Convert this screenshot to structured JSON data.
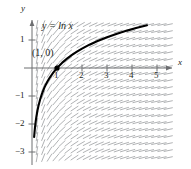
{
  "figure": {
    "background_color": "#ffffff"
  },
  "axes": {
    "x_axis_name": "x",
    "y_axis_name": "y",
    "axis_color": "#6d6e71",
    "origin_px": {
      "x": 32,
      "y": 68
    },
    "unit_px": {
      "x": 25,
      "y": 28
    },
    "x_ticks": [
      {
        "value": 1,
        "label": "1"
      },
      {
        "value": 2,
        "label": "2"
      },
      {
        "value": 3,
        "label": "3"
      },
      {
        "value": 4,
        "label": "4"
      },
      {
        "value": 5,
        "label": "5"
      }
    ],
    "y_ticks": [
      {
        "value": 1,
        "label": "1"
      },
      {
        "value": -1,
        "label": "−1"
      },
      {
        "value": -2,
        "label": "−2"
      },
      {
        "value": -3,
        "label": "−3"
      }
    ]
  },
  "annotations": {
    "equation_label": "y = ln x",
    "point_label": "(1, 0)",
    "point_marker": {
      "x": 1,
      "y": 0,
      "color": "#000000"
    }
  },
  "chart_data": {
    "type": "line",
    "title": "y = ln x",
    "xlabel": "x",
    "ylabel": "y",
    "xlim": [
      -0.2,
      6.2
    ],
    "ylim": [
      -3.5,
      1.7
    ],
    "grid": false,
    "legend": "none",
    "curve_color": "#000000",
    "slope_field": {
      "equation": "dy/dx = 1/x",
      "dash_color": "#a7a9ac",
      "x_samples": [
        0.2,
        0.45,
        0.7,
        0.95,
        1.2,
        1.45,
        1.7,
        1.95,
        2.2,
        2.45,
        2.7,
        2.95,
        3.2,
        3.45,
        3.7,
        3.95,
        4.2,
        4.45,
        4.7,
        4.95,
        5.2,
        5.45,
        5.7,
        5.95
      ],
      "y_samples": [
        1.55,
        1.3,
        1.05,
        0.8,
        0.55,
        0.3,
        0.05,
        -0.2,
        -0.45,
        -0.7,
        -0.95,
        -1.2,
        -1.45,
        -1.7,
        -1.95,
        -2.2,
        -2.45,
        -2.7,
        -2.95,
        -3.2
      ]
    },
    "series": [
      {
        "name": "y = ln x",
        "x": [
          0.085,
          0.1,
          0.12,
          0.15,
          0.18,
          0.22,
          0.27,
          0.33,
          0.4,
          0.5,
          0.6,
          0.7,
          0.85,
          1.0,
          1.2,
          1.4,
          1.6,
          1.8,
          2.0,
          2.3,
          2.6,
          3.0,
          3.4,
          3.8,
          4.2,
          4.6
        ],
        "y": [
          -2.465,
          -2.303,
          -2.12,
          -1.897,
          -1.715,
          -1.514,
          -1.309,
          -1.109,
          -0.916,
          -0.693,
          -0.511,
          -0.357,
          -0.163,
          0.0,
          0.182,
          0.336,
          0.47,
          0.588,
          0.693,
          0.833,
          0.956,
          1.099,
          1.224,
          1.335,
          1.435,
          1.526
        ]
      }
    ],
    "marked_points": [
      {
        "x": 1,
        "y": 0,
        "label": "(1, 0)"
      }
    ]
  }
}
